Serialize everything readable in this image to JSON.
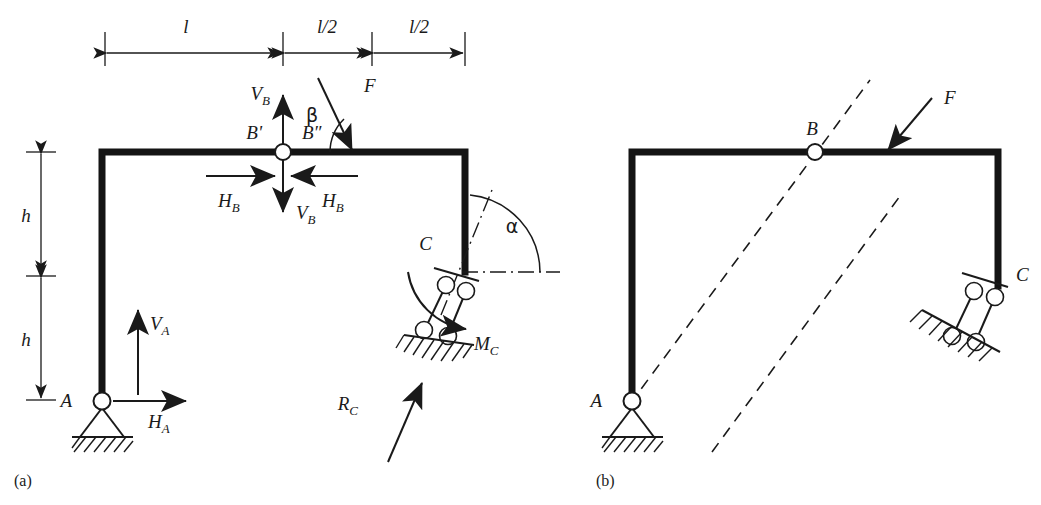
{
  "figure": {
    "caption_a": "(a)",
    "caption_b": "(b)"
  },
  "panel_a": {
    "dimensions": [
      {
        "id": "span-l",
        "label": "l"
      },
      {
        "id": "span-l-half-1",
        "label": "l/2"
      },
      {
        "id": "span-l-half-2",
        "label": "l/2"
      },
      {
        "id": "height-h-upper",
        "label": "h"
      },
      {
        "id": "height-h-lower",
        "label": "h"
      }
    ],
    "joints": [
      {
        "id": "joint-a",
        "label": "A"
      },
      {
        "id": "joint-b-left",
        "label": "B'"
      },
      {
        "id": "joint-b-right",
        "label": "B″"
      },
      {
        "id": "joint-c",
        "label": "C"
      }
    ],
    "forces": [
      {
        "id": "force-f",
        "label": "F"
      },
      {
        "id": "reaction-va",
        "label": "V",
        "sub": "A"
      },
      {
        "id": "reaction-ha",
        "label": "H",
        "sub": "A"
      },
      {
        "id": "internal-vb-up",
        "label": "V",
        "sub": "B"
      },
      {
        "id": "internal-vb-down",
        "label": "V",
        "sub": "B"
      },
      {
        "id": "internal-hb-left",
        "label": "H",
        "sub": "B"
      },
      {
        "id": "internal-hb-right",
        "label": "H",
        "sub": "B"
      },
      {
        "id": "moment-mc",
        "label": "M",
        "sub": "C"
      },
      {
        "id": "reaction-rc",
        "label": "R",
        "sub": "C"
      }
    ],
    "angles": [
      {
        "id": "angle-beta",
        "label": "β"
      },
      {
        "id": "angle-alpha",
        "label": "α"
      }
    ]
  },
  "panel_b": {
    "joints": [
      {
        "id": "joint-a",
        "label": "A"
      },
      {
        "id": "joint-b",
        "label": "B"
      },
      {
        "id": "joint-c",
        "label": "C"
      }
    ],
    "forces": [
      {
        "id": "force-f",
        "label": "F"
      }
    ]
  },
  "style": {
    "ink": "#141414",
    "paper": "#ffffff"
  }
}
